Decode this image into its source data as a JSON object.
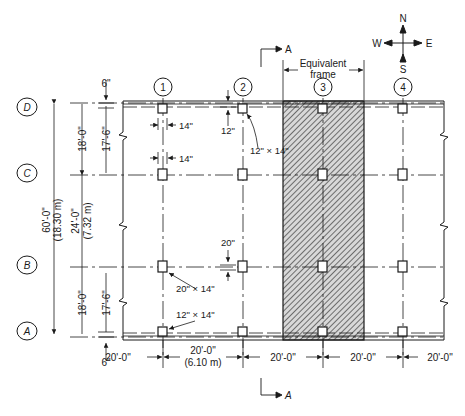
{
  "compass": {
    "north": "N",
    "south": "S",
    "east": "E",
    "west": "W"
  },
  "section_marker": {
    "top_label": "A",
    "bottom_label": "A"
  },
  "equivalent_frame": {
    "line1": "Equivalent",
    "line2": "frame"
  },
  "grid_columns": [
    {
      "id": "1",
      "x": 163
    },
    {
      "id": "2",
      "x": 243
    },
    {
      "id": "3",
      "x": 323
    },
    {
      "id": "4",
      "x": 403
    }
  ],
  "grid_rows": [
    {
      "id": "D",
      "y": 103
    },
    {
      "id": "C",
      "y": 173
    },
    {
      "id": "B",
      "y": 265
    },
    {
      "id": "A",
      "y": 333
    }
  ],
  "dimensions": {
    "top_offset": "6\"",
    "bottom_offset": "6\"",
    "col_width_1": "14\"",
    "col_width_2": "14\"",
    "slab_edge_12": "12\"",
    "slab_edge_20": "20\"",
    "column_size_interior": "12\" × 14\"",
    "column_size_edge_a": "12\" × 14\"",
    "column_size_b": "20\" × 14\"",
    "span_total": "60'-0\"",
    "span_total_metric": "(18.30 m)",
    "span_dc": "18'-0\"",
    "span_dc_clear": "17'-6\"",
    "span_cb": "24'-0\"",
    "span_cb_metric": "(7.32 m)",
    "span_ba": "18'-0\"",
    "span_ba_clear": "17'-6\"",
    "bay_1": "20'-0\"",
    "bay_2": "20'-0\"",
    "bay_2_metric": "(6.10 m)",
    "bay_3": "20'-0\"",
    "bay_4": "20'-0\"",
    "bay_5": "20'-0\""
  }
}
